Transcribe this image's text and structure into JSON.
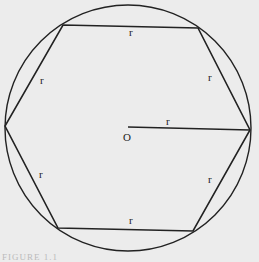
{
  "diagram": {
    "center_label": "O",
    "radius_label": "r",
    "side_labels": [
      "r",
      "r",
      "r",
      "r",
      "r",
      "r"
    ],
    "caption": "FIGURE 1.1",
    "colors": {
      "stroke": "#222222",
      "background": "#ececec"
    }
  }
}
